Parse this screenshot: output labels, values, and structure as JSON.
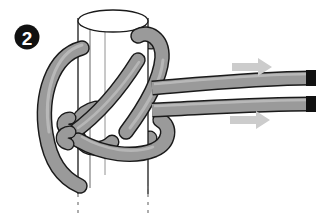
{
  "figure": {
    "step_number": "2",
    "background_color": "#ffffff"
  },
  "badge": {
    "label": "2",
    "fill_color": "#111111",
    "text_color": "#ffffff",
    "center_x": 27,
    "center_y": 37,
    "radius": 12
  },
  "pole": {
    "name": "vertical-pole",
    "fill_color": "#ffffff",
    "stroke_color": "#1a1a1a",
    "left_x": 78,
    "right_x": 148,
    "top_y": 10,
    "bottom_y": 196,
    "ellipse_ry": 11,
    "cut_marker": "dashed"
  },
  "rope": {
    "name": "rope",
    "fill_color": "#9a9a9a",
    "highlight_color": "#b8b8b8",
    "stroke_color": "#1a1a1a",
    "thickness": 13,
    "end_cap_color": "#111111",
    "strand_count": 2
  },
  "arrows": [
    {
      "name": "pull-arrow-upper",
      "direction": "right",
      "color": "#cccccc",
      "x": 232,
      "y": 67
    },
    {
      "name": "pull-arrow-lower",
      "direction": "right",
      "color": "#cccccc",
      "x": 230,
      "y": 120
    }
  ],
  "rope_ends": [
    {
      "name": "rope-end-upper",
      "x": 310,
      "y": 78
    },
    {
      "name": "rope-end-lower",
      "x": 310,
      "y": 104
    }
  ]
}
